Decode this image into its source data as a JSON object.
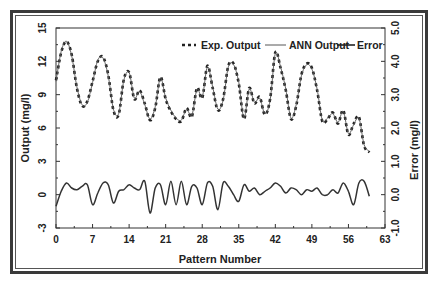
{
  "chart_data": {
    "type": "line",
    "title": "",
    "xlabel": "Pattern Number",
    "ylabel": "Output (mg/l)",
    "ylabel_right": "Error (mg/l)",
    "xlim": [
      0,
      63
    ],
    "ylim": [
      -3,
      15
    ],
    "ylim_right": [
      -1.0,
      5.0
    ],
    "x_ticks": [
      "0",
      "7",
      "14",
      "21",
      "28",
      "35",
      "42",
      "49",
      "56",
      "63"
    ],
    "y_ticks": [
      "-3",
      "0",
      "3",
      "6",
      "9",
      "12",
      "15"
    ],
    "y_ticks_right": [
      "-1.0",
      "0.0",
      "1.0",
      "2.0",
      "3.0",
      "4.0",
      "5.0"
    ],
    "grid": false,
    "legend_position": "top-right",
    "legend": [
      "Exp. Output",
      "ANN Output",
      "Error"
    ],
    "x": [
      0,
      1,
      2,
      3,
      4,
      5,
      6,
      7,
      8,
      9,
      10,
      11,
      12,
      13,
      14,
      15,
      16,
      17,
      18,
      19,
      20,
      21,
      22,
      23,
      24,
      25,
      26,
      27,
      28,
      29,
      30,
      31,
      32,
      33,
      34,
      35,
      36,
      37,
      38,
      39,
      40,
      41,
      42,
      43,
      44,
      45,
      46,
      47,
      48,
      49,
      50,
      51,
      52,
      53,
      54,
      55,
      56,
      57,
      58,
      59,
      60
    ],
    "series": [
      {
        "name": "Exp. Output",
        "axis": "left",
        "style": "dashed",
        "values": [
          10.3,
          12.8,
          13.8,
          12.6,
          9.6,
          8.0,
          8.4,
          10.2,
          12.0,
          12.4,
          10.8,
          7.6,
          7.2,
          10.4,
          11.0,
          8.6,
          9.4,
          8.2,
          6.7,
          7.8,
          10.6,
          8.6,
          7.5,
          6.8,
          6.6,
          7.8,
          7.0,
          9.6,
          8.7,
          11.6,
          9.6,
          7.6,
          8.6,
          11.6,
          11.8,
          10.0,
          6.8,
          9.6,
          8.2,
          8.8,
          7.2,
          8.6,
          12.8,
          11.4,
          9.4,
          6.8,
          8.0,
          10.8,
          11.8,
          11.4,
          9.4,
          6.6,
          6.8,
          7.4,
          6.4,
          7.6,
          5.4,
          6.4,
          7.0,
          4.4,
          3.8
        ]
      },
      {
        "name": "ANN Output",
        "axis": "left",
        "style": "solid-thin",
        "values": [
          10.2,
          12.9,
          13.8,
          12.5,
          9.7,
          8.1,
          8.3,
          10.1,
          12.1,
          12.3,
          10.7,
          7.7,
          7.3,
          10.3,
          11.0,
          8.7,
          9.3,
          8.1,
          6.8,
          7.9,
          10.5,
          8.7,
          7.6,
          6.9,
          6.7,
          7.7,
          7.1,
          9.5,
          8.8,
          11.5,
          9.7,
          7.7,
          8.5,
          11.5,
          11.7,
          10.1,
          6.9,
          9.5,
          8.3,
          8.7,
          7.3,
          8.5,
          12.7,
          11.5,
          9.5,
          6.9,
          8.1,
          10.7,
          11.7,
          11.3,
          9.5,
          6.7,
          6.9,
          7.3,
          6.5,
          7.5,
          5.5,
          6.3,
          6.9,
          4.5,
          3.9
        ]
      },
      {
        "name": "Error",
        "axis": "right",
        "style": "solid",
        "values": [
          -0.35,
          0.1,
          0.35,
          0.2,
          0.15,
          0.25,
          0.3,
          -0.3,
          0.05,
          0.35,
          0.3,
          -0.25,
          0.1,
          0.15,
          0.3,
          0.2,
          0.15,
          0.4,
          -0.55,
          0.2,
          0.3,
          -0.3,
          0.4,
          -0.3,
          0.4,
          -0.3,
          0.25,
          0.2,
          -0.3,
          0.35,
          0.25,
          -0.45,
          0.35,
          0.25,
          0.0,
          -0.2,
          0.3,
          0.1,
          0.2,
          0.0,
          0.1,
          0.2,
          0.35,
          0.25,
          0.05,
          0.2,
          0.15,
          0.0,
          0.15,
          0.1,
          0.2,
          0.0,
          0.0,
          0.15,
          0.05,
          0.35,
          0.1,
          -0.3,
          0.35,
          0.4,
          -0.05
        ]
      }
    ]
  }
}
